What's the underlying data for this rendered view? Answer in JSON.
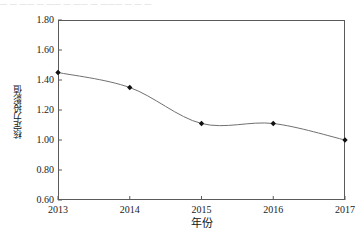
{
  "figure": {
    "top_fragment_text": "—  —  —— — ——  — —— —  ———  — — —",
    "background_color": "#ffffff",
    "frame_color": "#5a5a5a"
  },
  "chart_data": {
    "type": "line",
    "title": "",
    "subtitle": "",
    "xlabel": "年份",
    "ylabel": "核定力投影值",
    "categories": [
      "2013",
      "2014",
      "2015",
      "2016",
      "2017"
    ],
    "x": [
      2013,
      2014,
      2015,
      2016,
      2017
    ],
    "values": [
      1.45,
      1.35,
      1.11,
      1.11,
      1.0
    ],
    "series": [
      {
        "name": "核定力投影值",
        "values": [
          1.45,
          1.35,
          1.11,
          1.11,
          1.0
        ],
        "line_color": "#707070",
        "marker_color": "#111111",
        "marker": "diamond"
      }
    ],
    "ylim": [
      0.6,
      1.8
    ],
    "yticks": [
      0.6,
      0.8,
      1.0,
      1.2,
      1.4,
      1.6,
      1.8
    ],
    "ytick_labels": [
      "0.60",
      "0.80",
      "1.00",
      "1.20",
      "1.40",
      "1.60",
      "1.80"
    ],
    "xlim": [
      2013,
      2017
    ],
    "xticks": [
      2013,
      2014,
      2015,
      2016,
      2017
    ],
    "xtick_labels": [
      "2013",
      "2014",
      "2015",
      "2016",
      "2017"
    ],
    "grid": false,
    "legend": false,
    "legend_position": "none",
    "smoothing": "spline",
    "annotations": []
  }
}
